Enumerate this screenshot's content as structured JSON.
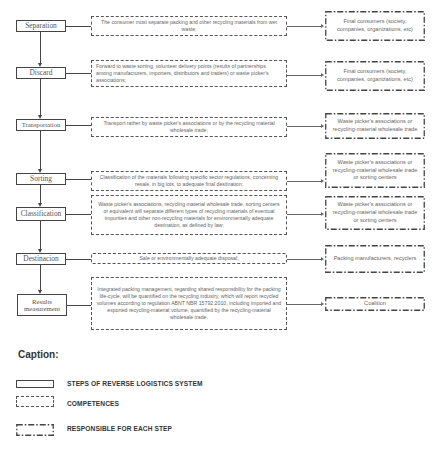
{
  "diagram": {
    "rows": [
      {
        "step": "Separation",
        "competence": "The consumer must separate packing and other recycling materials from wet waste;",
        "responsible": "Final consumers (society, companies, organizations, etc)"
      },
      {
        "step": "Discard",
        "competence": "Forward to waste sorting, volunteer delivery points (results of partnerships among manufacturers, importers, distributors and traders) or waste picker's associations;",
        "responsible": "Final consumers (society, companies, organizations, etc)"
      },
      {
        "step": "Transportation",
        "competence": "Transport rather by waste picker's associations or by the recycling material wholesale trade;",
        "responsible": "Waste picker's associations or recycling-material wholesale trade"
      },
      {
        "step": "Sorting",
        "competence": "Classification of the materials following specific sector regulations, concerning resale, in big lots, to adequate final destination;",
        "responsible": "Waste picker's associations or recycling-material wholesale trade or sorting centers"
      },
      {
        "step": "Classification",
        "competence": "Waste picker's associations, recycling material wholesale trade, sorting centers or equivalent will separate different types of recycling materials of eventual impurities and other non-recycling materials for environmentally adequate destination, as defined by law;",
        "responsible": "Waste picker's associations or recycling-material wholesale trade or sorting centers"
      },
      {
        "step": "Destinacion",
        "competence": "Sale or environmentally adequate disposal;",
        "responsible": "Packing manufacturers, recyclers"
      },
      {
        "step": "Results measurement",
        "competence": "Integrated packing management, regarding shared responsibility for the packing life-cycle, will be quantified on the recycling industry, which will report recycled volumes according to regulation ABNT NBR 15792:2010, including imported and exported recycling-material volume, quantified by the recycling-material wholesale trade.",
        "responsible": "Coalition"
      }
    ]
  },
  "caption": {
    "title": "Caption:",
    "legend": [
      {
        "style": "solid",
        "label": "STEPS OF REVERSE LOGISTICS SYSTEM"
      },
      {
        "style": "dashed",
        "label": "COMPETENCES"
      },
      {
        "style": "dash-dot",
        "label": "RESPONSIBLE FOR EACH STEP"
      }
    ]
  },
  "colors": {
    "line": "#444444",
    "text": "#555555",
    "background": "#ffffff"
  }
}
